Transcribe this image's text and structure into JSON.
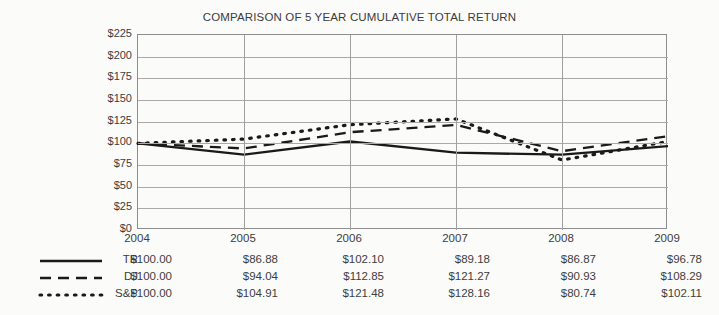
{
  "chart_data": {
    "type": "line",
    "title": "COMPARISON OF 5 YEAR CUMULATIVE TOTAL RETURN",
    "xlabel": "",
    "ylabel": "",
    "categories": [
      "2004",
      "2005",
      "2006",
      "2007",
      "2008",
      "2009"
    ],
    "ylim": [
      0,
      225
    ],
    "ytick_step": 25,
    "ytick_labels": [
      "$225",
      "$200",
      "$175",
      "$150",
      "$125",
      "$100",
      "$75",
      "$50",
      "$25",
      "$0"
    ],
    "ytick_values": [
      225,
      200,
      175,
      150,
      125,
      100,
      75,
      50,
      25,
      0
    ],
    "grid": true,
    "legend_position": "below-left",
    "series": [
      {
        "name": "TR",
        "style": "solid",
        "color": "#1a1a1a",
        "values": [
          100.0,
          86.88,
          102.1,
          89.18,
          86.87,
          96.78
        ],
        "labels": [
          "$100.00",
          "$86.88",
          "$102.10",
          "$89.18",
          "$86.87",
          "$96.78"
        ]
      },
      {
        "name": "DJ",
        "style": "dashed",
        "color": "#1a1a1a",
        "values": [
          100.0,
          94.04,
          112.85,
          121.27,
          90.93,
          108.29
        ],
        "labels": [
          "$100.00",
          "$94.04",
          "$112.85",
          "$121.27",
          "$90.93",
          "$108.29"
        ]
      },
      {
        "name": "S&P",
        "style": "dotted",
        "color": "#1a1a1a",
        "values": [
          100.0,
          104.91,
          121.48,
          128.16,
          80.74,
          102.11
        ],
        "labels": [
          "$100.00",
          "$104.91",
          "$121.48",
          "$128.16",
          "$80.74",
          "$102.11"
        ]
      }
    ]
  }
}
